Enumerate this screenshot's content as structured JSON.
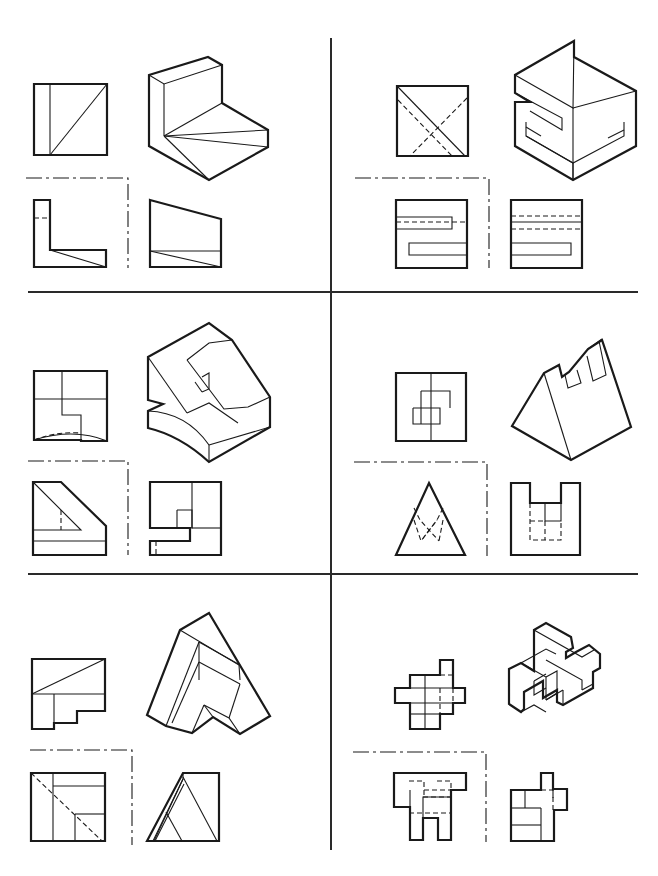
{
  "page": {
    "background": "#ffffff",
    "ink_color": "#1a1a1a"
  },
  "dividers": [
    {
      "name": "vertical-divider",
      "d": "M331 38 L331 850"
    },
    {
      "name": "horizontal-divider-1",
      "d": "M28 292 L638 292"
    },
    {
      "name": "horizontal-divider-2",
      "d": "M28 574 L638 574"
    }
  ],
  "panels": [
    {
      "id": 1,
      "label": "Panel 1 - L-bracket with triangular web",
      "views": {
        "top": {
          "thick": [
            "M34 84 L107 84 L107 155 L34 155 Z"
          ],
          "thin": [
            "M50 84 L50 155",
            "M50 155 L107 84"
          ],
          "hidden": []
        },
        "front": {
          "thick": [
            "M34 200 L50 200 L50 250 L106 250 L106 267 L34 267 Z"
          ],
          "thin": [
            "M50 250 L106 267"
          ],
          "hidden": [
            "M34 218 L50 218"
          ]
        },
        "side": {
          "thick": [
            "M150 200 L221 219 L221 267 L150 267 Z"
          ],
          "thin": [
            "M150 251 L221 251",
            "M150 251 L221 267"
          ],
          "hidden": []
        },
        "iso": {
          "thick": [
            "M149 75 L208 57 L222 65 L222 103 L268 130 L268 147 L209 180 L149 146 Z"
          ],
          "thin": [
            "M149 75 L164 84 L222 65",
            "M164 84 L164 136",
            "M164 136 L222 103",
            "M164 136 L268 130",
            "M164 136 L268 147",
            "M164 136 L209 180"
          ],
          "hidden": []
        },
        "center": [
          "M26 178 L128 178 L128 268"
        ]
      }
    },
    {
      "id": 2,
      "label": "Panel 2 - Block with S-shaped slots",
      "views": {
        "top": {
          "thick": [
            "M397 86 L468 86 L468 156 L397 156 Z"
          ],
          "thin": [
            "M397 86 L465 156",
            "M397 86 L397 156"
          ],
          "hidden": [
            "M398 100 L452 156",
            "M467 98 L410 156"
          ]
        },
        "front": {
          "thick": [
            "M396 200 L467 200 L467 268 L396 268 Z"
          ],
          "thin": [
            "M396 217 L452 217 L452 229 L396 229",
            "M409 243 L467 243 L467 255 L409 255 Z"
          ],
          "hidden": [
            "M396 222 L467 222"
          ]
        },
        "side": {
          "thick": [
            "M511 200 L582 200 L582 268 L511 268 Z"
          ],
          "thin": [
            "M511 222 L582 222",
            "M511 243 L571 243 L571 255 L511 255"
          ],
          "hidden": [
            "M511 216 L582 216",
            "M511 229 L582 229"
          ]
        },
        "iso": {
          "thick": [
            "M574 41 L574 57 L636 91 L636 146 L573 180 L515 146 L515 102 L530 102 L515 93 L515 75 Z"
          ],
          "thin": [
            "M515 75 L573 108 L574 41",
            "M573 108 L636 91",
            "M573 108 L573 180",
            "M515 93 L562 118 L562 130 L530 111",
            "M526 122 L526 136 L573 163 L624 136 L624 122",
            "M573 163 L573 180",
            "M526 136 L573 163",
            "M541 136 L526 127",
            "M608 138 L624 130"
          ],
          "hidden": []
        },
        "center": [
          "M355 178 L489 178 L489 268"
        ]
      }
    },
    {
      "id": 3,
      "label": "Panel 3 - Block with curved base and notch",
      "views": {
        "top": {
          "thick": [
            "M34 371 L107 371 L107 441 L81 441 L81 440 L34 440 Z"
          ],
          "thin": [
            "M34 399 L107 399",
            "M62 371 L62 415 L81 415 L81 441",
            "M34 440 C60 432 85 432 107 441"
          ],
          "hidden": [
            "M34 440 C50 434 65 432 80 433"
          ]
        },
        "front": {
          "thick": [
            "M33 482 L61 482 L106 526 L106 555 L33 555 Z"
          ],
          "thin": [
            "M33 530 L81 530 L33 482",
            "M33 541 L106 541"
          ],
          "hidden": [
            "M61 510 L61 530"
          ]
        },
        "side": {
          "thick": [
            "M150 482 L221 482 L221 555 L150 555 L150 541 L190 541 L190 528 L150 528 Z"
          ],
          "thin": [
            "M192 482 L192 528",
            "M177 510 L192 510 L192 528 L177 528 L177 510",
            "M192 528 L221 528"
          ],
          "hidden": [
            "M156 541 L156 555"
          ]
        },
        "iso": {
          "thick": [
            "M148 357 L209 323 L232 340 L270 397 L270 427 L209 462 C185 440 165 432 148 428 L148 411 L163 404 L148 400 Z"
          ],
          "thin": [
            "M148 357 L187 413",
            "M187 413 L209 403 L238 423",
            "M187 360 L209 343 L232 340",
            "M187 360 L224 409 L248 407 L270 397",
            "M148 411 C175 412 195 425 209 445",
            "M209 445 L270 427",
            "M209 445 L209 462",
            "M202 377 L209 373 L209 389 L202 392",
            "M195 382 L202 392"
          ],
          "hidden": []
        },
        "center": [
          "M28 461 L128 461 L128 555"
        ]
      }
    },
    {
      "id": 4,
      "label": "Panel 4 - Triangular prism with notches",
      "views": {
        "top": {
          "thick": [
            "M396 373 L466 373 L466 441 L396 441 Z"
          ],
          "thin": [
            "M431 373 L431 441",
            "M421 391 L450 391 L450 408",
            "M413 408 L440 408 L440 424 L413 424 L413 408",
            "M421 391 L421 424"
          ],
          "hidden": []
        },
        "front": {
          "thick": [
            "M429 483 L465 555 L396 555 Z"
          ],
          "thin": [],
          "hidden": [
            "M414 508 L420 520 L439 541",
            "M443 508 L437 520 L421 541",
            "M414 520 L421 541 L437 520",
            "M443 520 L439 541"
          ]
        },
        "side": {
          "thick": [
            "M511 483 L530 483 L530 503 L561 503 L561 483 L580 483 L580 555 L511 555 Z"
          ],
          "thin": [
            "M545 503 L545 521 L561 521 L561 503"
          ],
          "hidden": [
            "M530 503 L530 540 L561 540 L561 521",
            "M545 521 L545 540",
            "M530 521 L545 521"
          ]
        },
        "iso": {
          "thick": [
            "M512 426 L544 373 L559 365 L562 377 L569 372 L588 349 L602 340 L631 427 L571 460 Z"
          ],
          "thin": [
            "M544 373 L571 460",
            "M565 375 L568 388 L581 383 L577 370",
            "M588 349 L602 339",
            "M587 356 L593 381 L606 375 L599 341"
          ],
          "hidden": []
        },
        "center": [
          "M354 462 L487 462 L487 556"
        ]
      }
    },
    {
      "id": 5,
      "label": "Panel 5 - Angled wedge block",
      "views": {
        "top": {
          "thick": [
            "M32 659 L105 659 L105 711 L77 711 L77 723 L54 723 L54 729 L32 729 Z"
          ],
          "thin": [
            "M32 694 L105 694",
            "M54 694 L54 723",
            "M32 694 L105 659"
          ],
          "hidden": []
        },
        "front": {
          "thick": [
            "M31 773 L105 773 L105 841 L31 841 Z"
          ],
          "thin": [
            "M53 773 L53 841",
            "M53 786 L105 786",
            "M75 814 L105 814",
            "M75 814 L75 841"
          ],
          "hidden": [
            "M31 773 L102 841"
          ]
        },
        "side": {
          "thick": [
            "M147 841 L183 773 L219 773 L219 841 Z"
          ],
          "thin": [
            "M153 841 L183 779 L183 773",
            "M183 779 L154 841",
            "M155 841 L184 784",
            "M166 812 L182 841",
            "M183 777 L217 841"
          ],
          "hidden": []
        },
        "iso": {
          "thick": [
            "M180 630 L209 613 L270 716 L240 734 L213 717 L192 733 L166 726 L147 715 Z"
          ],
          "thin": [
            "M180 630 L239 665 L240 680",
            "M199 642 L199 662",
            "M199 642 L240 665",
            "M199 662 L240 684",
            "M166 726 L199 642",
            "M172 723 L199 662",
            "M199 662 L199 680",
            "M240 684 L229 718",
            "M204 705 L213 717",
            "M204 705 L192 733",
            "M204 705 L229 718 L240 734"
          ],
          "hidden": []
        },
        "center": [
          "M30 750 L132 750 L132 845"
        ]
      }
    },
    {
      "id": 6,
      "label": "Panel 6 - Interlocking bars",
      "views": {
        "top": {
          "thick": [
            "M440 660 L453 660 L453 688 L465 688 L465 703 L453 703 L453 714 L440 714 L440 729 L410 729 L410 703 L395 703 L395 688 L410 688 L410 675 L440 675 Z"
          ],
          "thin": [
            "M395 688 L465 688",
            "M395 703 L465 703",
            "M425 675 L425 714",
            "M410 714 L440 714",
            "M425 729 L425 714"
          ],
          "hidden": [
            "M440 675 L453 675",
            "M440 688 L440 714",
            "M453 688 L453 703"
          ]
        },
        "front": {
          "thick": [
            "M394 773 L466 773 L466 790 L451 790 L451 840 L438 840 L438 818 L423 818 L423 840 L410 840 L410 807 L394 807 Z"
          ],
          "thin": [
            "M423 818 L423 797 L451 797",
            "M410 790 L410 807"
          ],
          "hidden": [
            "M409 781 L424 781 L424 797",
            "M437 781 L451 781 L451 790",
            "M423 797 L451 797",
            "M409 813 L451 813",
            "M424 790 L451 790"
          ]
        },
        "side": {
          "thick": [
            "M541 773 L553 773 L553 789 L567 789 L567 810 L554 810 L554 841 L511 841 L511 790 L541 790 Z"
          ],
          "thin": [
            "M511 808 L525 808",
            "M525 790 L525 808",
            "M511 825 L541 825",
            "M541 808 L541 841",
            "M525 808 L541 808"
          ],
          "hidden": [
            "M553 789 L553 810",
            "M553 810 L567 810",
            "M541 790 L553 790 L553 798"
          ]
        },
        "iso": {
          "thick": [
            "M534 630 L546 623 L571 637 L573 648 L566 652 L566 658 L576 652 L589 645 L600 654 L600 668 L593 672 L593 688 L563 705 L557 702 L557 690 L543 698 L543 681 L524 692 L524 709 L521 712 L509 704 L509 669 L521 663 L534 671 Z"
          ],
          "thin": [
            "M534 630 L534 660",
            "M534 630 L582 657 L594 650",
            "M546 660 L582 680 L582 690",
            "M521 663 L546 677 L546 700",
            "M521 663 L546 649 L556 654",
            "M546 677 L557 671 L557 690",
            "M534 681 L546 674",
            "M534 681 L534 695 L546 688",
            "M546 700 L557 693",
            "M582 690 L593 684",
            "M546 700 L563 690",
            "M563 690 L563 705",
            "M521 712 L534 705 L546 712"
          ],
          "hidden": []
        },
        "center": [
          "M353 752 L486 752 L486 842"
        ]
      }
    }
  ]
}
